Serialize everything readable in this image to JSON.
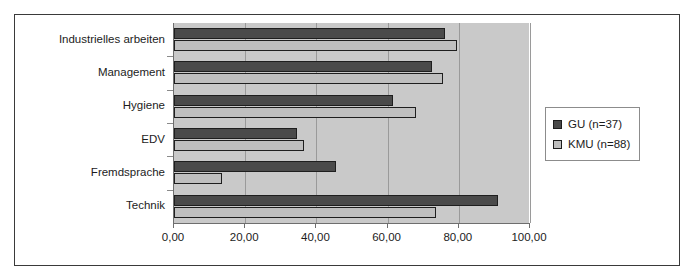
{
  "figure": {
    "frame_border_color": "#3a3a3a",
    "plot_background": "#c9c9c9"
  },
  "legend": {
    "position": "right",
    "entries": [
      {
        "label": "GU (n=37)",
        "color": "#4a4a4a",
        "swatch_name": "legend-swatch-gu"
      },
      {
        "label": "KMU (n=88)",
        "color": "#bfbfbf",
        "swatch_name": "legend-swatch-kmu"
      }
    ]
  },
  "chart_data": {
    "type": "bar",
    "orientation": "horizontal",
    "title": "",
    "xlabel": "",
    "ylabel": "",
    "xlim": [
      0,
      100
    ],
    "grid": true,
    "categories": [
      "Industrielles arbeiten",
      "Management",
      "Hygiene",
      "EDV",
      "Fremdsprache",
      "Technik"
    ],
    "xtick_labels": [
      "0,00",
      "20,00",
      "40,00",
      "60,00",
      "80,00",
      "100,00"
    ],
    "xticks": [
      0,
      20,
      40,
      60,
      80,
      100
    ],
    "series": [
      {
        "name": "GU (n=37)",
        "color": "#4a4a4a",
        "values": [
          76.0,
          72.5,
          61.5,
          34.5,
          45.5,
          91.0
        ]
      },
      {
        "name": "KMU (n=88)",
        "color": "#bfbfbf",
        "values": [
          79.5,
          75.5,
          68.0,
          36.5,
          13.5,
          73.5
        ]
      }
    ]
  }
}
